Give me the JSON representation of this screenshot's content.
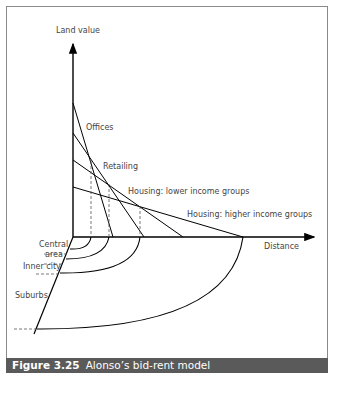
{
  "figure": {
    "number": "Figure 3.25",
    "title": "Alonso’s bid-rent model"
  },
  "axes": {
    "y_label": "Land value",
    "x_label": "Distance"
  },
  "curves": [
    {
      "label": "Offices"
    },
    {
      "label": "Retailing"
    },
    {
      "label": "Housing: lower income groups"
    },
    {
      "label": "Housing: higher income groups"
    }
  ],
  "zones": [
    {
      "label_line1": "Central",
      "label_line2": "area"
    },
    {
      "label": "Inner city"
    },
    {
      "label": "Suburbs"
    }
  ]
}
